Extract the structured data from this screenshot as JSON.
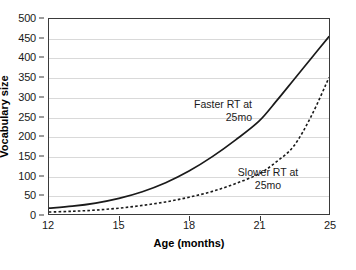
{
  "chart_data": {
    "type": "line",
    "title": "",
    "xlabel": "Age (months)",
    "ylabel": "Vocabulary size",
    "xlim": [
      12,
      25
    ],
    "ylim": [
      0,
      500
    ],
    "grid": true,
    "legend_position": "inline-annotations",
    "x_tick_labels": [
      "12",
      "15",
      "18",
      "21",
      "25"
    ],
    "y_tick_labels": [
      "0",
      "50",
      "100",
      "150",
      "200",
      "250",
      "300",
      "350",
      "400",
      "450",
      "500"
    ],
    "y_ticks": [
      0,
      50,
      100,
      150,
      200,
      250,
      300,
      350,
      400,
      450,
      500
    ],
    "x": [
      12,
      13,
      14,
      15,
      16,
      17,
      18,
      19,
      20,
      21,
      22,
      23,
      24,
      25
    ],
    "series": [
      {
        "name": "Faster RT at 25mo",
        "style": "solid",
        "color": "#1a1a1a",
        "annotation": "Faster RT at\n25mo",
        "values": [
          15,
          20,
          28,
          40,
          57,
          80,
          110,
          147,
          190,
          238,
          290,
          345,
          400,
          455
        ]
      },
      {
        "name": "Slower RT at 25mo",
        "style": "dashed",
        "color": "#1a1a1a",
        "annotation": "Slower RT at\n25mo",
        "values": [
          5,
          7,
          10,
          15,
          22,
          31,
          43,
          58,
          78,
          103,
          134,
          175,
          252,
          350
        ]
      }
    ]
  }
}
